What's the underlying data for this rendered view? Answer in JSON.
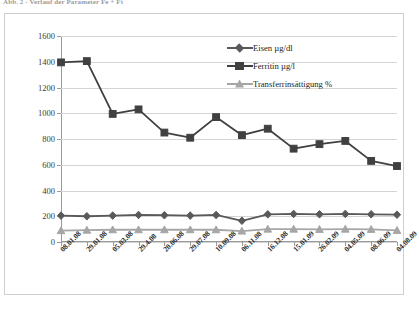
{
  "figure": {
    "caption": "Abb. 2 - Verlauf der Parameter Fe + Ft"
  },
  "chart_data": {
    "type": "line",
    "title": "",
    "xlabel": "",
    "ylabel": "",
    "ylim": [
      0,
      1600
    ],
    "ytick_step": 200,
    "yticks": [
      "0",
      "200",
      "400",
      "600",
      "800",
      "1000",
      "1200",
      "1400",
      "1600"
    ],
    "grid": true,
    "legend_position": "top-right-inside",
    "categories": [
      "08.01.08",
      "29.01.08",
      "05.03.08",
      "29.4.08",
      "20.06.08",
      "29.07.08",
      "10.09.08",
      "06.11.08",
      "16.12.08",
      "15.01.09",
      "26.02.09",
      "04.05.09",
      "08.06.09",
      "04.08.09"
    ],
    "series": [
      {
        "name": "Eisen µg/dl",
        "color": "#595959",
        "marker": "diamond",
        "values": [
          205,
          200,
          205,
          210,
          208,
          205,
          210,
          165,
          215,
          218,
          215,
          218,
          215,
          212
        ]
      },
      {
        "name": "Ferritin µg/l",
        "color": "#404040",
        "marker": "square",
        "values": [
          1395,
          1405,
          995,
          1030,
          850,
          810,
          970,
          830,
          880,
          725,
          760,
          785,
          630,
          590
        ]
      },
      {
        "name": "Transferrinsättigung %",
        "color": "#a6a6a6",
        "marker": "triangle",
        "values": [
          88,
          92,
          95,
          95,
          95,
          95,
          95,
          85,
          100,
          100,
          98,
          100,
          98,
          90
        ]
      }
    ]
  },
  "legend": {
    "items": [
      {
        "label": "Eisen µg/dl"
      },
      {
        "label": "Ferritin µg/l"
      },
      {
        "label": "Transferrinsättigung %"
      }
    ]
  }
}
